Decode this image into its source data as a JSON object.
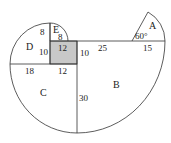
{
  "diagram": {
    "colors": {
      "stroke": "#333333",
      "shade": "#c8c8c8",
      "background": "#ffffff"
    },
    "regions": {
      "A": "A",
      "B": "B",
      "C": "C",
      "D": "D",
      "E": "E"
    },
    "angle_label": "60°",
    "measurements": {
      "e_radius": "8",
      "d_top": "8",
      "d_side": "10",
      "square_top": "12",
      "square_side": "10",
      "b_top": "25",
      "a_base": "15",
      "c_top_left": "18",
      "c_top_right": "12",
      "b_side": "30"
    }
  }
}
